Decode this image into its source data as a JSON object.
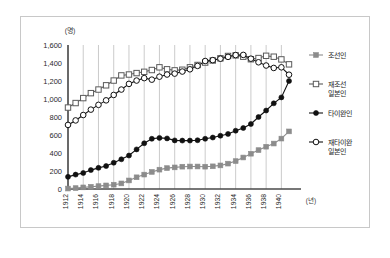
{
  "chart_data": {
    "type": "line",
    "title": "",
    "xlabel": "(년)",
    "ylabel": "(명)",
    "x": [
      1912,
      1913,
      1914,
      1915,
      1916,
      1917,
      1918,
      1919,
      1920,
      1921,
      1922,
      1923,
      1924,
      1925,
      1926,
      1927,
      1928,
      1929,
      1930,
      1931,
      1932,
      1933,
      1934,
      1935,
      1936,
      1937,
      1938,
      1939,
      1940,
      1941
    ],
    "xlim": [
      1912,
      1941
    ],
    "ylim": [
      0,
      1600
    ],
    "yticks": [
      0,
      200,
      400,
      600,
      800,
      1000,
      1200,
      1400,
      1600
    ],
    "ytick_labels": [
      "0",
      "200",
      "400",
      "600",
      "800",
      "1,000",
      "1,200",
      "1,400",
      "1,600"
    ],
    "xtick_labels": [
      "1912",
      "1914",
      "1916",
      "1918",
      "1920",
      "1922",
      "1924",
      "1926",
      "1928",
      "1930",
      "1932",
      "1934",
      "1936",
      "1938",
      "1940"
    ],
    "grid": "vertical-only",
    "legend_position": "right",
    "series": [
      {
        "name": "조선인",
        "marker": "filled-square",
        "color": "#8c8c8c",
        "values": [
          5,
          10,
          18,
          25,
          32,
          40,
          48,
          62,
          95,
          130,
          160,
          190,
          215,
          232,
          240,
          248,
          250,
          250,
          248,
          252,
          262,
          282,
          310,
          350,
          392,
          432,
          470,
          505,
          560,
          640
        ]
      },
      {
        "name": "재조선 일본인",
        "marker": "open-square",
        "color": "#5a5a5a",
        "values": [
          905,
          955,
          1010,
          1065,
          1105,
          1152,
          1205,
          1262,
          1272,
          1288,
          1302,
          1322,
          1352,
          1330,
          1318,
          1325,
          1352,
          1378,
          1405,
          1428,
          1452,
          1478,
          1485,
          1470,
          1442,
          1455,
          1480,
          1470,
          1440,
          1385
        ]
      },
      {
        "name": "타이완인",
        "marker": "filled-circle",
        "color": "#111111",
        "values": [
          135,
          160,
          178,
          210,
          235,
          255,
          292,
          330,
          372,
          440,
          508,
          558,
          568,
          562,
          540,
          538,
          538,
          542,
          558,
          572,
          592,
          612,
          648,
          678,
          722,
          800,
          872,
          952,
          1018,
          1200
        ]
      },
      {
        "name": "재타이완 일본인",
        "marker": "open-circle",
        "color": "#111111",
        "values": [
          712,
          762,
          822,
          882,
          935,
          985,
          1045,
          1105,
          1168,
          1205,
          1232,
          1215,
          1248,
          1272,
          1282,
          1305,
          1330,
          1368,
          1422,
          1432,
          1448,
          1468,
          1488,
          1490,
          1448,
          1408,
          1372,
          1345,
          1352,
          1270
        ]
      }
    ]
  },
  "caption": {
    "text": ""
  }
}
